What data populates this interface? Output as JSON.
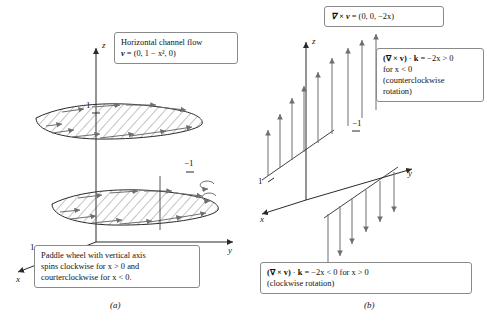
{
  "figure": {
    "panel_a": {
      "caption": "(a)",
      "callout_top": {
        "line1": "Horizontal channel flow",
        "line2_bold": "v",
        "line2_rest": " = (0, 1 − x², 0)"
      },
      "callout_bottom": {
        "line1": "Paddle wheel with vertical axis",
        "line2": "spins clockwise for x > 0 and",
        "line3": "courterclockwise for x < 0."
      },
      "axis_labels": {
        "x": "x",
        "y": "y",
        "z": "z"
      },
      "tick_labels": {
        "z_upper": "1",
        "x_left": "1",
        "neg_one": "−1"
      }
    },
    "panel_b": {
      "caption": "(b)",
      "callout_top": {
        "bold": "∇ × v",
        "rest": " = (0, 0, −2x)"
      },
      "callout_right": {
        "line1_bold_a": "(∇ × v)",
        "line1_mid": " · ",
        "line1_bold_b": "k",
        "line1_rest": " = −2x > 0",
        "line2": "for x < 0",
        "line3": "(counterclockwise",
        "line4": "rotation)"
      },
      "callout_bottom": {
        "line1_bold_a": "(∇ × v)",
        "line1_mid": " · ",
        "line1_bold_b": "k",
        "line1_rest": " = −2x < 0 for x > 0",
        "line2": "(clockwise rotation)"
      },
      "axis_labels": {
        "x": "x",
        "y": "y",
        "z": "z"
      },
      "tick_labels": {
        "neg_one": "−1",
        "x_one": "1"
      }
    },
    "page_edge_mark": ""
  },
  "colors": {
    "stroke": "#2b2b2b",
    "hatch": "#4a4a4a",
    "arrow": "#6e6e6e",
    "box_border": "#8a8a8a",
    "background": "#ffffff"
  }
}
